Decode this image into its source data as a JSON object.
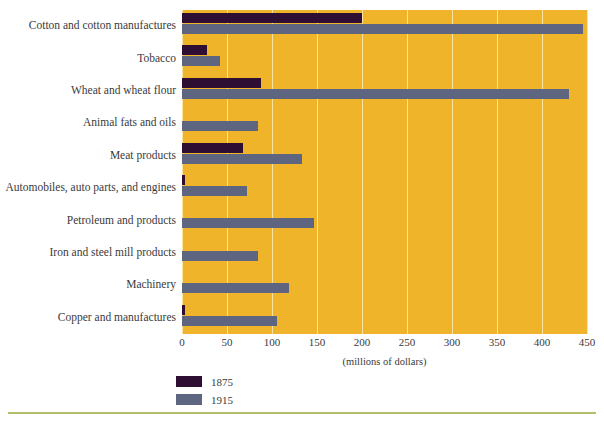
{
  "chart_data": {
    "type": "bar",
    "orientation": "horizontal",
    "title": "",
    "xlabel": "(millions of dollars)",
    "ylabel": "",
    "xlim": [
      0,
      450
    ],
    "xticks": [
      0,
      50,
      100,
      150,
      200,
      250,
      300,
      350,
      400,
      450
    ],
    "grid": true,
    "legend_position": "bottom-left",
    "categories": [
      "Cotton and cotton manufactures",
      "Tobacco",
      "Wheat and wheat flour",
      "Animal fats and oils",
      "Meat products",
      "Automobiles, auto parts, and engines",
      "Petroleum and products",
      "Iron and steel mill products",
      "Machinery",
      "Copper and manufactures"
    ],
    "series": [
      {
        "name": "1875",
        "color": "#2e0f33",
        "values": [
          200,
          28,
          88,
          0,
          68,
          3,
          0,
          0,
          0,
          3
        ]
      },
      {
        "name": "1915",
        "color": "#5e6580",
        "values": [
          445,
          42,
          430,
          84,
          133,
          72,
          147,
          84,
          119,
          106
        ]
      }
    ]
  },
  "colors": {
    "plot_background": "#f0b42a",
    "gridline": "#fbe4a0",
    "series_1875": "#2e0f33",
    "series_1915": "#5e6580",
    "text": "#3a3a3a",
    "page_background": "#ffffff",
    "bottom_rule": "#b5bf6a"
  }
}
